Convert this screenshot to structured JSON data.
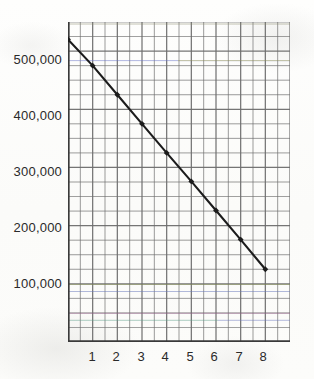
{
  "chart_data": {
    "type": "line",
    "title": "",
    "subtitle": "",
    "xlabel": "",
    "ylabel": "",
    "x": [
      0,
      1,
      2,
      3,
      4,
      5,
      6,
      7,
      8
    ],
    "values": [
      520000,
      475000,
      425000,
      375000,
      325000,
      276000,
      226000,
      176000,
      125000
    ],
    "series": [
      {
        "name": "",
        "x": [
          0,
          1,
          2,
          3,
          4,
          5,
          6,
          7,
          8
        ],
        "values": [
          520000,
          475000,
          425000,
          375000,
          325000,
          276000,
          226000,
          176000,
          125000
        ]
      }
    ],
    "ytick_labels": [
      "500,000",
      "400,000",
      "300,000",
      "200,000",
      "100,000"
    ],
    "ytick_values": [
      500000,
      400000,
      300000,
      200000,
      100000
    ],
    "xtick_labels": [
      "1",
      "2",
      "3",
      "4",
      "5",
      "6",
      "7",
      "8"
    ],
    "xtick_values": [
      1,
      2,
      3,
      4,
      5,
      6,
      7,
      8
    ],
    "xlim": [
      0,
      9
    ],
    "ylim": [
      0,
      550000
    ],
    "grid": true,
    "grid_major_y_step": 100000,
    "grid_minor_y_step": 25000,
    "grid_minor_x_step": 0.5,
    "legend": "none",
    "marker": "diamond",
    "line_color": "#1c1c1c",
    "grid_color": "#6e6e6e",
    "axis_color": "#3a3a3a",
    "background_color": "#fdfdfb",
    "text_color": "#2a2a2a"
  }
}
